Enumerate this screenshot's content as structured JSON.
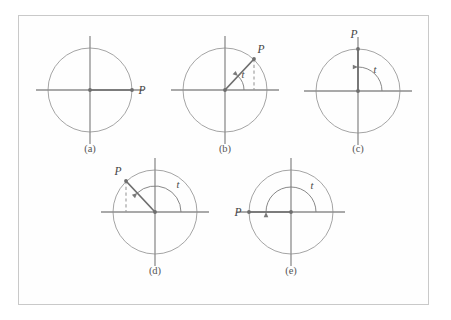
{
  "figure": {
    "background_color": "#ffffff",
    "frame_color": "#c9c9c9",
    "axis_color": "#8d8d8d",
    "circle_color": "#9a9a9a",
    "radius_color": "#6e6e6e",
    "dash_color": "#9a9a9a",
    "arc_color": "#7a7a7a",
    "text_color": "#555555",
    "frame": {
      "x": 18,
      "y": 15,
      "width": 411,
      "height": 290
    }
  },
  "chart_data": {
    "type": "diagram",
    "xlabel": "",
    "ylabel": "",
    "panels": [
      {
        "id": "a",
        "caption": "(a)",
        "center": {
          "x": 90,
          "y": 90
        },
        "radius": 42,
        "axis_half_length": 54,
        "terminal_point": {
          "x": 132,
          "y": 90
        },
        "angle_degrees": 0,
        "point_label": "P",
        "point_label_pos": {
          "x": 142,
          "y": 94
        },
        "angle_label": "",
        "angle_label_pos": null,
        "arc_radius": 0,
        "has_arc": false,
        "has_dashed_drop": false,
        "caption_pos": {
          "x": 90,
          "y": 152
        }
      },
      {
        "id": "b",
        "caption": "(b)",
        "center": {
          "x": 225,
          "y": 90
        },
        "radius": 42,
        "axis_half_length": 54,
        "terminal_point": {
          "x": 254,
          "y": 59
        },
        "angle_degrees": 47,
        "point_label": "P",
        "point_label_pos": {
          "x": 261,
          "y": 53
        },
        "angle_label": "t",
        "angle_label_pos": {
          "x": 243,
          "y": 78
        },
        "arc_radius": 19,
        "has_arc": true,
        "has_dashed_drop": true,
        "caption_pos": {
          "x": 225,
          "y": 152
        }
      },
      {
        "id": "c",
        "caption": "(c)",
        "center": {
          "x": 358,
          "y": 91
        },
        "radius": 42,
        "axis_half_length": 54,
        "terminal_point": {
          "x": 358,
          "y": 49
        },
        "angle_degrees": 90,
        "point_label": "P",
        "point_label_pos": {
          "x": 354,
          "y": 38
        },
        "angle_label": "t",
        "angle_label_pos": {
          "x": 375,
          "y": 73
        },
        "arc_radius": 24,
        "has_arc": true,
        "has_dashed_drop": false,
        "caption_pos": {
          "x": 358,
          "y": 152
        }
      },
      {
        "id": "d",
        "caption": "(d)",
        "center": {
          "x": 155,
          "y": 212
        },
        "radius": 42,
        "axis_half_length": 54,
        "terminal_point": {
          "x": 126,
          "y": 181
        },
        "angle_degrees": 133,
        "point_label": "P",
        "point_label_pos": {
          "x": 118,
          "y": 175
        },
        "angle_label": "t",
        "angle_label_pos": {
          "x": 178,
          "y": 188
        },
        "arc_radius": 26,
        "has_arc": true,
        "has_dashed_drop": true,
        "caption_pos": {
          "x": 155,
          "y": 274
        }
      },
      {
        "id": "e",
        "caption": "(e)",
        "center": {
          "x": 291,
          "y": 212
        },
        "radius": 42,
        "axis_half_length": 54,
        "terminal_point": {
          "x": 249,
          "y": 212
        },
        "angle_degrees": 180,
        "point_label": "P",
        "point_label_pos": {
          "x": 238,
          "y": 216
        },
        "angle_label": "t",
        "angle_label_pos": {
          "x": 312,
          "y": 189
        },
        "arc_radius": 25,
        "has_arc": true,
        "has_dashed_drop": false,
        "caption_pos": {
          "x": 291,
          "y": 274
        }
      }
    ]
  }
}
